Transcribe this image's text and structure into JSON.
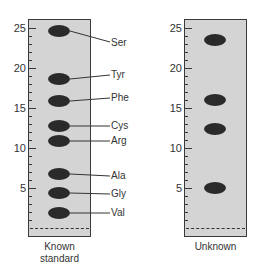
{
  "diagram": {
    "type": "paper-chromatography",
    "axis": {
      "ticks": [
        "25",
        "20",
        "15",
        "10",
        "5"
      ],
      "range": [
        0,
        26
      ]
    },
    "strips": [
      {
        "caption_line1": "Known",
        "caption_line2": "standard",
        "spots": [
          {
            "label": "Ser",
            "position": 24.6
          },
          {
            "label": "Tyr",
            "position": 18.6
          },
          {
            "label": "Phe",
            "position": 15.9
          },
          {
            "label": "Cys",
            "position": 12.7
          },
          {
            "label": "Arg",
            "position": 10.9
          },
          {
            "label": "Ala",
            "position": 6.8
          },
          {
            "label": "Gly",
            "position": 4.4
          },
          {
            "label": "Val",
            "position": 1.9
          }
        ]
      },
      {
        "caption_line1": "Unknown",
        "spots": [
          {
            "position": 23.5
          },
          {
            "position": 16.0
          },
          {
            "position": 12.4
          },
          {
            "position": 5.0
          }
        ]
      }
    ]
  },
  "colors": {
    "paper": "#d4d4d4",
    "spot": "#2a2a2a",
    "outline": "#3a3a3a"
  }
}
